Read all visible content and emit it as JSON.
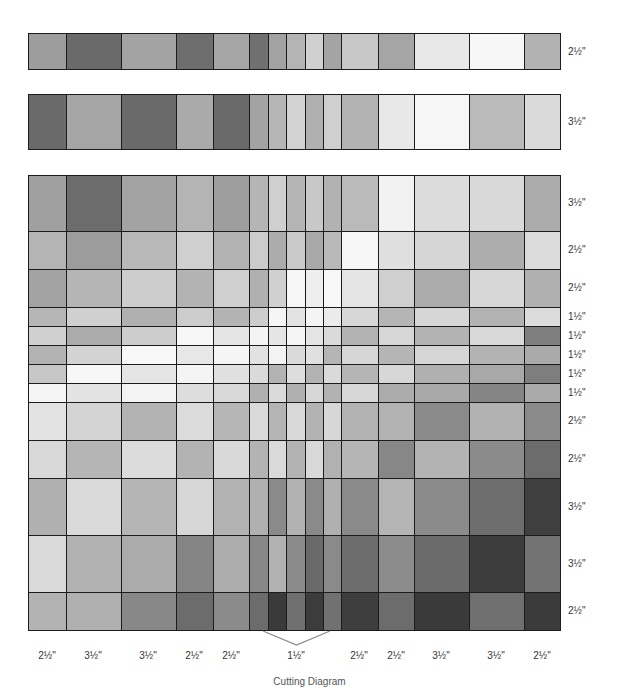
{
  "diagram": {
    "caption": "Cutting Diagram",
    "col_edges": [
      28,
      66,
      121,
      176,
      213,
      249,
      268,
      286,
      305,
      323,
      341,
      378,
      414,
      469,
      524,
      560
    ],
    "column_labels": [
      {
        "text": "2½\"",
        "x": 47
      },
      {
        "text": "3½\"",
        "x": 93
      },
      {
        "text": "3½\"",
        "x": 148
      },
      {
        "text": "2½\"",
        "x": 194
      },
      {
        "text": "2½\"",
        "x": 231
      },
      {
        "text": "1½\"",
        "x": 296
      },
      {
        "text": "2½\"",
        "x": 359
      },
      {
        "text": "2½\"",
        "x": 396
      },
      {
        "text": "3½\"",
        "x": 441
      },
      {
        "text": "3½\"",
        "x": 496
      },
      {
        "text": "2½\"",
        "x": 542
      }
    ],
    "brace": {
      "x1": 263,
      "x2": 330,
      "top": 631,
      "apex_y": 645,
      "color": "#8a8a8a"
    },
    "strips": [
      {
        "name": "strip-2-5",
        "top": 33,
        "bottom": 70,
        "label": "2½\"",
        "colors": [
          "#9d9d9d",
          "#6a6a6a",
          "#a3a3a3",
          "#6e6e6e",
          "#a6a6a6",
          "#707070",
          "#a2a2a2",
          "#b4b4b4",
          "#d0d0d0",
          "#a4a4a4",
          "#c8c8c8",
          "#a5a5a5",
          "#e8e8e8",
          "#f7f7f7",
          "#b2b2b2"
        ]
      },
      {
        "name": "strip-3-5",
        "top": 94,
        "bottom": 150,
        "label": "3½\"",
        "colors": [
          "#6a6a6a",
          "#a5a5a5",
          "#6a6a6a",
          "#aaaaaa",
          "#6a6a6a",
          "#a3a3a3",
          "#b6b6b6",
          "#d2d2d2",
          "#b0b0b0",
          "#cfcfcf",
          "#b3b3b3",
          "#e8e8e8",
          "#f6f6f6",
          "#bababa",
          "#dadada"
        ]
      }
    ],
    "grid": {
      "row_edges": [
        175,
        231,
        269,
        307,
        326,
        345,
        364,
        383,
        402,
        440,
        478,
        535,
        592,
        630
      ],
      "row_labels": [
        "3½\"",
        "2½\"",
        "2½\"",
        "1½\"",
        "1½\"",
        "1½\"",
        "1½\"",
        "1½\"",
        "2½\"",
        "2½\"",
        "3½\"",
        "3½\"",
        "2½\""
      ],
      "rows": [
        [
          "#a0a0a0",
          "#6c6c6c",
          "#a3a3a3",
          "#b4b4b4",
          "#9e9e9e",
          "#b5b5b5",
          "#cfcfcf",
          "#b4b4b4",
          "#c8c8c8",
          "#b2b2b2",
          "#bababa",
          "#f2f2f2",
          "#dcdcdc",
          "#d9d9d9",
          "#ababab"
        ],
        [
          "#b4b4b4",
          "#9c9c9c",
          "#b9b9b9",
          "#cfcfcf",
          "#b3b3b3",
          "#cccccc",
          "#acacac",
          "#c9c9c9",
          "#a8a8a8",
          "#b9b9b9",
          "#f6f6f6",
          "#dfdfdf",
          "#d6d6d6",
          "#adadad",
          "#dbdbdb"
        ],
        [
          "#a3a3a3",
          "#b5b5b5",
          "#cdcdcd",
          "#b3b3b3",
          "#cfcfcf",
          "#b0b0b0",
          "#d0d0d0",
          "#f6f6f6",
          "#eeeeee",
          "#f8f8f8",
          "#e5e5e5",
          "#cfcfcf",
          "#ababab",
          "#d7d7d7",
          "#b0b0b0"
        ],
        [
          "#b6b6b6",
          "#d0d0d0",
          "#b0b0b0",
          "#cccccc",
          "#b3b3b3",
          "#cdcdcd",
          "#f5f5f5",
          "#e3e3e3",
          "#f4f4f4",
          "#ebebeb",
          "#d7d7d7",
          "#b5b5b5",
          "#d6d6d6",
          "#b3b3b3",
          "#dcdcdc"
        ],
        [
          "#d0d0d0",
          "#ababab",
          "#cdcdcd",
          "#f7f7f7",
          "#e5e5e5",
          "#f4f4f4",
          "#e5e5e5",
          "#f5f5f5",
          "#e4e4e4",
          "#dadada",
          "#b3b3b3",
          "#d7d7d7",
          "#b3b3b3",
          "#d8d8d8",
          "#7f7f7f"
        ],
        [
          "#b3b3b3",
          "#d3d3d3",
          "#f8f8f8",
          "#e7e7e7",
          "#f5f5f5",
          "#e2e2e2",
          "#f3f3f3",
          "#dadada",
          "#e0e0e0",
          "#b5b5b5",
          "#d6d6d6",
          "#b5b5b5",
          "#d5d5d5",
          "#b3b3b3",
          "#aaaaaa"
        ],
        [
          "#c7c7c7",
          "#f6f6f6",
          "#e5e5e5",
          "#f4f4f4",
          "#e0e0e0",
          "#dadada",
          "#b3b3b3",
          "#dddddd",
          "#b3b3b3",
          "#dadada",
          "#b5b5b5",
          "#d7d7d7",
          "#b0b0b0",
          "#a8a8a8",
          "#7e7e7e"
        ],
        [
          "#f5f5f5",
          "#e3e3e3",
          "#f3f3f3",
          "#dddddd",
          "#d8d8d8",
          "#b0b0b0",
          "#dadada",
          "#b0b0b0",
          "#d7d7d7",
          "#b1b1b1",
          "#d7d7d7",
          "#acacac",
          "#a9a9a9",
          "#858585",
          "#aaaaaa"
        ],
        [
          "#e3e3e3",
          "#d4d4d4",
          "#b3b3b3",
          "#dcdcdc",
          "#b6b6b6",
          "#dadada",
          "#b4b4b4",
          "#d8d8d8",
          "#b3b3b3",
          "#d7d7d7",
          "#b3b3b3",
          "#b3b3b3",
          "#8a8a8a",
          "#b1b1b1",
          "#8a8a8a"
        ],
        [
          "#d8d8d8",
          "#b5b5b5",
          "#dbdbdb",
          "#b3b3b3",
          "#d9d9d9",
          "#b3b3b3",
          "#dadada",
          "#b3b3b3",
          "#d9d9d9",
          "#b1b1b1",
          "#b5b5b5",
          "#878787",
          "#b3b3b3",
          "#8b8b8b",
          "#6c6c6c"
        ],
        [
          "#b0b0b0",
          "#dadada",
          "#b5b5b5",
          "#d7d7d7",
          "#b3b3b3",
          "#b0b0b0",
          "#8a8a8a",
          "#b2b2b2",
          "#8a8a8a",
          "#b0b0b0",
          "#8a8a8a",
          "#b4b4b4",
          "#8b8b8b",
          "#6e6e6e",
          "#3f3f3f"
        ],
        [
          "#dadada",
          "#b1b1b1",
          "#ababab",
          "#858585",
          "#adadad",
          "#888888",
          "#b2b2b2",
          "#8a8a8a",
          "#6a6a6a",
          "#8a8a8a",
          "#6c6c6c",
          "#8c8c8c",
          "#6b6b6b",
          "#3c3c3c",
          "#737373"
        ],
        [
          "#b3b3b3",
          "#b0b0b0",
          "#888888",
          "#6c6c6c",
          "#8b8b8b",
          "#6c6c6c",
          "#3a3a3a",
          "#707070",
          "#3c3c3c",
          "#717171",
          "#3e3e3e",
          "#6c6c6c",
          "#3a3a3a",
          "#6f6f6f",
          "#3b3b3b"
        ]
      ]
    }
  }
}
